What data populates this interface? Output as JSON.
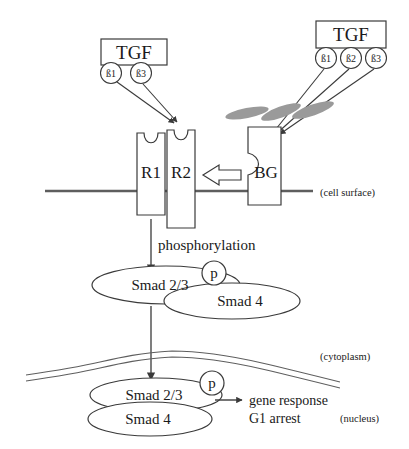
{
  "diagram": {
    "ligands": {
      "left_box": {
        "name": "TGF",
        "isoforms": [
          {
            "label": "ß1"
          },
          {
            "label": "ß3"
          }
        ]
      },
      "right_box": {
        "name": "TGF",
        "isoforms": [
          {
            "label": "ß1"
          },
          {
            "label": "ß2"
          },
          {
            "label": "ß3"
          }
        ]
      }
    },
    "receptors": [
      {
        "label": "R1"
      },
      {
        "label": "R2"
      },
      {
        "label": "BG"
      }
    ],
    "membranes": {
      "cell_surface_label": "(cell surface)",
      "cytoplasm_label": "(cytoplasm)",
      "nucleus_label": "(nucleus)"
    },
    "processes": {
      "phosphorylation": "phosphorylation",
      "phosphate_marker": "p"
    },
    "complexes": {
      "cytoplasmic": {
        "smad_23": "Smad 2/3",
        "smad_4": "Smad 4",
        "phosphate": "p"
      },
      "nuclear": {
        "smad_23": "Smad 2/3",
        "smad_4": "Smad 4",
        "phosphate": "p"
      }
    },
    "outcome": {
      "line1": "gene response",
      "line2": "G1 arrest"
    },
    "colors": {
      "stroke": "#3a3a3a",
      "membrane": "#5e5e5e",
      "ligand_blob": "#9a9a9a",
      "background": "#ffffff"
    }
  }
}
